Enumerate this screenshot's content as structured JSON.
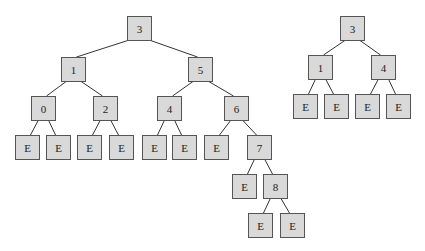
{
  "colors": {
    "node_fill": "#d9d9d9",
    "node_border": "#555555",
    "edge": "#333333",
    "text": "#222222"
  },
  "trees": [
    {
      "name": "left-tree",
      "nodes": [
        {
          "id": "L3",
          "label": "3",
          "x": 127,
          "y": 16
        },
        {
          "id": "L1",
          "label": "1",
          "x": 61,
          "y": 57
        },
        {
          "id": "L5",
          "label": "5",
          "x": 188,
          "y": 57
        },
        {
          "id": "L0",
          "label": "0",
          "x": 31,
          "y": 96
        },
        {
          "id": "L2",
          "label": "2",
          "x": 93,
          "y": 96
        },
        {
          "id": "L4",
          "label": "4",
          "x": 157,
          "y": 96
        },
        {
          "id": "L6",
          "label": "6",
          "x": 224,
          "y": 96
        },
        {
          "id": "LE1",
          "label": "E",
          "x": 15,
          "y": 135
        },
        {
          "id": "LE2",
          "label": "E",
          "x": 46,
          "y": 135
        },
        {
          "id": "LE3",
          "label": "E",
          "x": 77,
          "y": 135
        },
        {
          "id": "LE4",
          "label": "E",
          "x": 109,
          "y": 135
        },
        {
          "id": "LE5",
          "label": "E",
          "x": 142,
          "y": 135
        },
        {
          "id": "LE6",
          "label": "E",
          "x": 172,
          "y": 135
        },
        {
          "id": "LE7",
          "label": "E",
          "x": 204,
          "y": 135
        },
        {
          "id": "L7",
          "label": "7",
          "x": 247,
          "y": 135
        },
        {
          "id": "LE8",
          "label": "E",
          "x": 232,
          "y": 174
        },
        {
          "id": "L8",
          "label": "8",
          "x": 263,
          "y": 174
        },
        {
          "id": "LE9",
          "label": "E",
          "x": 248,
          "y": 213
        },
        {
          "id": "LE10",
          "label": "E",
          "x": 280,
          "y": 213
        }
      ],
      "edges": [
        [
          "L3",
          "L1"
        ],
        [
          "L3",
          "L5"
        ],
        [
          "L1",
          "L0"
        ],
        [
          "L1",
          "L2"
        ],
        [
          "L5",
          "L4"
        ],
        [
          "L5",
          "L6"
        ],
        [
          "L0",
          "LE1"
        ],
        [
          "L0",
          "LE2"
        ],
        [
          "L2",
          "LE3"
        ],
        [
          "L2",
          "LE4"
        ],
        [
          "L4",
          "LE5"
        ],
        [
          "L4",
          "LE6"
        ],
        [
          "L6",
          "LE7"
        ],
        [
          "L6",
          "L7"
        ],
        [
          "L7",
          "LE8"
        ],
        [
          "L7",
          "L8"
        ],
        [
          "L8",
          "LE9"
        ],
        [
          "L8",
          "LE10"
        ]
      ]
    },
    {
      "name": "right-tree",
      "nodes": [
        {
          "id": "R3",
          "label": "3",
          "x": 340,
          "y": 16
        },
        {
          "id": "R1",
          "label": "1",
          "x": 308,
          "y": 55
        },
        {
          "id": "R4",
          "label": "4",
          "x": 371,
          "y": 55
        },
        {
          "id": "RE1",
          "label": "E",
          "x": 293,
          "y": 94
        },
        {
          "id": "RE2",
          "label": "E",
          "x": 324,
          "y": 94
        },
        {
          "id": "RE3",
          "label": "E",
          "x": 355,
          "y": 94
        },
        {
          "id": "RE4",
          "label": "E",
          "x": 386,
          "y": 94
        }
      ],
      "edges": [
        [
          "R3",
          "R1"
        ],
        [
          "R3",
          "R4"
        ],
        [
          "R1",
          "RE1"
        ],
        [
          "R1",
          "RE2"
        ],
        [
          "R4",
          "RE3"
        ],
        [
          "R4",
          "RE4"
        ]
      ]
    }
  ]
}
